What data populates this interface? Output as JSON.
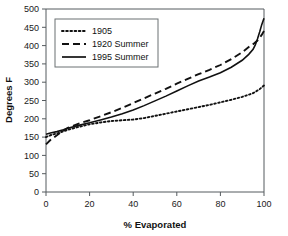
{
  "chart_data": {
    "type": "line",
    "title": "",
    "xlabel": "% Evaporated",
    "ylabel": "Degrees F",
    "xlim": [
      0,
      100
    ],
    "ylim": [
      0,
      500
    ],
    "xticks": [
      0,
      20,
      40,
      60,
      80,
      100
    ],
    "yticks": [
      0,
      50,
      100,
      150,
      200,
      250,
      300,
      350,
      400,
      450,
      500
    ],
    "grid": false,
    "legend_position": "upper-left-inside",
    "series": [
      {
        "name": "1905",
        "style": "dotted",
        "x": [
          0,
          2,
          5,
          8,
          10,
          15,
          20,
          25,
          30,
          35,
          40,
          45,
          50,
          55,
          60,
          65,
          70,
          75,
          80,
          85,
          90,
          95,
          98,
          100
        ],
        "values": [
          150,
          155,
          160,
          166,
          170,
          178,
          185,
          190,
          194,
          196,
          198,
          202,
          208,
          214,
          220,
          226,
          232,
          238,
          245,
          252,
          260,
          270,
          281,
          291
        ]
      },
      {
        "name": "1920 Summer",
        "style": "dashed",
        "x": [
          0,
          2,
          5,
          8,
          10,
          15,
          20,
          25,
          30,
          35,
          40,
          45,
          50,
          55,
          60,
          65,
          70,
          75,
          80,
          85,
          90,
          93,
          95,
          97,
          98,
          99,
          100
        ],
        "values": [
          130,
          142,
          155,
          168,
          175,
          187,
          196,
          207,
          218,
          230,
          243,
          256,
          269,
          282,
          296,
          309,
          322,
          334,
          347,
          363,
          382,
          396,
          404,
          414,
          421,
          430,
          440
        ]
      },
      {
        "name": "1995 Summer",
        "style": "solid",
        "x": [
          0,
          2,
          5,
          8,
          10,
          15,
          20,
          25,
          30,
          35,
          40,
          45,
          50,
          55,
          60,
          65,
          70,
          75,
          80,
          85,
          90,
          93,
          95,
          96,
          97,
          98,
          99,
          100
        ],
        "values": [
          158,
          161,
          165,
          170,
          174,
          182,
          189,
          197,
          205,
          214,
          224,
          236,
          249,
          262,
          276,
          290,
          303,
          314,
          326,
          341,
          360,
          376,
          390,
          402,
          418,
          437,
          458,
          475
        ]
      }
    ]
  },
  "legend": {
    "entries": [
      {
        "label": "1905"
      },
      {
        "label": "1920 Summer"
      },
      {
        "label": "1995 Summer"
      }
    ]
  }
}
